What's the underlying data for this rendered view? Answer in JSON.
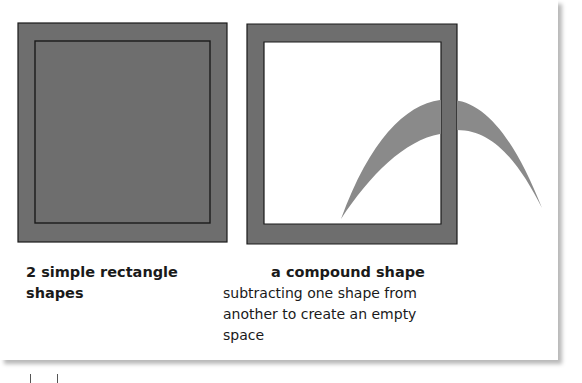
{
  "diagram": {
    "colors": {
      "fill": "#6e6e6e",
      "curve": "#8a8a8a",
      "stroke": "#1a1a1a",
      "background": "#ffffff",
      "text": "#1a1a1a"
    },
    "left": {
      "caption": "2 simple rectangle shapes"
    },
    "right": {
      "caption_title": "a compound shape",
      "caption_lines": [
        "subtracting one shape from",
        "another to create an empty",
        "space"
      ]
    }
  }
}
